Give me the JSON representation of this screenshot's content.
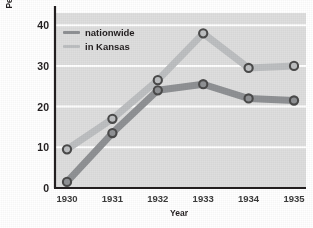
{
  "chart_data": {
    "type": "line",
    "title": "",
    "xlabel": "Year",
    "ylabel": "Percent of Unemployment",
    "categories": [
      "1930",
      "1931",
      "1932",
      "1933",
      "1934",
      "1935"
    ],
    "series": [
      {
        "name": "nationwide",
        "color": "#8f9194",
        "values": [
          1.5,
          13.5,
          24.0,
          25.5,
          22.0,
          21.5
        ]
      },
      {
        "name": "in Kansas",
        "color": "#bdbfc1",
        "values": [
          9.5,
          17.0,
          26.5,
          38.0,
          29.5,
          30.0
        ]
      }
    ],
    "ylim": [
      0,
      43
    ],
    "yticks": [
      "0",
      "10",
      "20",
      "30",
      "40"
    ],
    "ytick_values": [
      0,
      10,
      20,
      30,
      40
    ],
    "grid": "horizontal-white",
    "legend_position": "top-left-inside",
    "plot_background": "#dedede",
    "gridline_color": "#ffffff",
    "axis_color": "#231f20",
    "marker_ring_color": "#4a4a4a",
    "text_color": "#231f20"
  },
  "legend": {
    "items": [
      {
        "label": "nationwide"
      },
      {
        "label": "in Kansas"
      }
    ]
  },
  "axes": {
    "y_title": "Percent of Unemployment",
    "x_title": "Year"
  }
}
